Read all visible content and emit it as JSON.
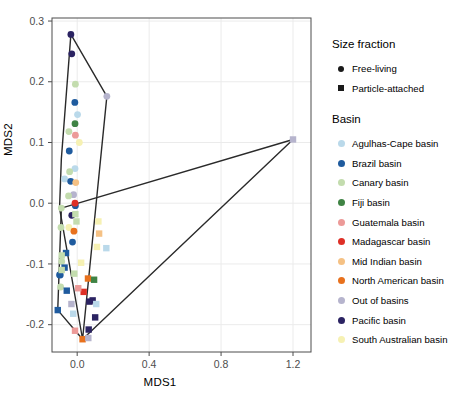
{
  "chart_data": {
    "type": "scatter",
    "title": "",
    "xlabel": "MDS1",
    "ylabel": "MDS2",
    "xlim": [
      -0.14,
      1.3
    ],
    "ylim": [
      -0.245,
      0.305
    ],
    "xticks": [
      0.0,
      0.4,
      0.8,
      1.2
    ],
    "xticklabels": [
      "0.0",
      "0.4",
      "0.8",
      "1.2"
    ],
    "yticks": [
      -0.2,
      -0.1,
      0.0,
      0.1,
      0.2,
      0.3
    ],
    "yticklabels": [
      "-0.2",
      "-0.1",
      "0.0",
      "0.1",
      "0.2",
      "0.3"
    ],
    "grid": true,
    "legend_position": "right",
    "legends": [
      {
        "title": "Size fraction",
        "entries": [
          {
            "label": "Free-living",
            "marker": "circle",
            "color": "#1a1a1a"
          },
          {
            "label": "Particle-attached",
            "marker": "square",
            "color": "#1a1a1a"
          }
        ]
      },
      {
        "title": "Basin",
        "entries": [
          {
            "label": "Agulhas-Cape basin",
            "marker": "circle",
            "color": "#bad9ea"
          },
          {
            "label": "Brazil basin",
            "marker": "circle",
            "color": "#1f5b9e"
          },
          {
            "label": "Canary basin",
            "marker": "circle",
            "color": "#c3dcae"
          },
          {
            "label": "Fiji basin",
            "marker": "circle",
            "color": "#3f8344"
          },
          {
            "label": "Guatemala basin",
            "marker": "circle",
            "color": "#ec9a98"
          },
          {
            "label": "Madagascar basin",
            "marker": "circle",
            "color": "#de2f26"
          },
          {
            "label": "Mid Indian basin",
            "marker": "circle",
            "color": "#f5c184"
          },
          {
            "label": "North American basin",
            "marker": "circle",
            "color": "#e8711d"
          },
          {
            "label": "Out of basins",
            "marker": "circle",
            "color": "#b6b4cd"
          },
          {
            "label": "Pacific basin",
            "marker": "circle",
            "color": "#2b2362"
          },
          {
            "label": "South Australian basin",
            "marker": "circle",
            "color": "#f6f1b3"
          }
        ]
      }
    ],
    "hulls": [
      {
        "name": "free-living-hull",
        "points": [
          [
            -0.035,
            0.278
          ],
          [
            0.165,
            0.176
          ],
          [
            0.03,
            -0.224
          ],
          [
            -0.098,
            -0.008
          ],
          [
            -0.088,
            0.073
          ]
        ]
      },
      {
        "name": "particle-attached-hull",
        "points": [
          [
            -0.088,
            -0.008
          ],
          [
            1.2,
            0.105
          ],
          [
            0.03,
            -0.224
          ],
          [
            -0.108,
            -0.176
          ]
        ]
      }
    ],
    "series": [
      {
        "name": "Free-living",
        "marker": "circle",
        "points": [
          {
            "x": -0.035,
            "y": 0.278,
            "basin": "Pacific basin",
            "color": "#2b2362"
          },
          {
            "x": -0.03,
            "y": 0.246,
            "basin": "Pacific basin",
            "color": "#2b2362"
          },
          {
            "x": -0.01,
            "y": 0.196,
            "basin": "Canary basin",
            "color": "#c3dcae"
          },
          {
            "x": -0.013,
            "y": 0.166,
            "basin": "Brazil basin",
            "color": "#1f5b9e"
          },
          {
            "x": 0.002,
            "y": 0.146,
            "basin": "Agulhas-Cape basin",
            "color": "#bad9ea"
          },
          {
            "x": -0.012,
            "y": 0.131,
            "basin": "Fiji basin",
            "color": "#3f8344"
          },
          {
            "x": -0.046,
            "y": 0.118,
            "basin": "Canary basin",
            "color": "#c3dcae"
          },
          {
            "x": -0.01,
            "y": 0.112,
            "basin": "Guatemala basin",
            "color": "#ec9a98"
          },
          {
            "x": 0.012,
            "y": 0.1,
            "basin": "South Australian basin",
            "color": "#f6f1b3"
          },
          {
            "x": -0.044,
            "y": 0.086,
            "basin": "Brazil basin",
            "color": "#1f5b9e"
          },
          {
            "x": 0.165,
            "y": 0.176,
            "basin": "Out of basins",
            "color": "#b6b4cd"
          },
          {
            "x": -0.012,
            "y": 0.057,
            "basin": "Agulhas-Cape basin",
            "color": "#bad9ea"
          },
          {
            "x": -0.042,
            "y": 0.052,
            "basin": "Canary basin",
            "color": "#c3dcae"
          },
          {
            "x": -0.07,
            "y": 0.04,
            "basin": "Agulhas-Cape basin",
            "color": "#bad9ea"
          },
          {
            "x": -0.036,
            "y": 0.036,
            "basin": "Brazil basin",
            "color": "#1f5b9e"
          },
          {
            "x": -0.008,
            "y": 0.034,
            "basin": "Mid Indian basin",
            "color": "#f5c184"
          },
          {
            "x": -0.02,
            "y": 0.014,
            "basin": "Out of basins",
            "color": "#b6b4cd"
          },
          {
            "x": -0.048,
            "y": 0.012,
            "basin": "Canary basin",
            "color": "#c3dcae"
          },
          {
            "x": -0.01,
            "y": -0.004,
            "basin": "Brazil basin",
            "color": "#1f5b9e"
          },
          {
            "x": -0.088,
            "y": -0.008,
            "basin": "Canary basin",
            "color": "#c3dcae"
          },
          {
            "x": -0.03,
            "y": -0.02,
            "basin": "Pacific basin",
            "color": "#2b2362"
          },
          {
            "x": -0.046,
            "y": -0.04,
            "basin": "South Australian basin",
            "color": "#f6f1b3"
          },
          {
            "x": -0.018,
            "y": -0.046,
            "basin": "North American basin",
            "color": "#e8711d"
          },
          {
            "x": -0.026,
            "y": -0.064,
            "basin": "Brazil basin",
            "color": "#1f5b9e"
          },
          {
            "x": -0.09,
            "y": -0.04,
            "basin": "Canary basin",
            "color": "#c3dcae"
          },
          {
            "x": -0.086,
            "y": -0.096,
            "basin": "Canary basin",
            "color": "#c3dcae"
          },
          {
            "x": -0.094,
            "y": -0.118,
            "basin": "Brazil basin",
            "color": "#1f5b9e"
          },
          {
            "x": -0.098,
            "y": -0.118,
            "basin": "Brazil basin",
            "color": "#1f5b9e"
          },
          {
            "x": -0.092,
            "y": -0.138,
            "basin": "Canary basin",
            "color": "#c3dcae"
          },
          {
            "x": -0.012,
            "y": 0.0,
            "basin": "Madagascar basin",
            "color": "#de2f26"
          }
        ]
      },
      {
        "name": "Particle-attached",
        "marker": "square",
        "points": [
          {
            "x": 1.2,
            "y": 0.105,
            "basin": "Out of basins",
            "color": "#b6b4cd"
          },
          {
            "x": -0.01,
            "y": -0.018,
            "basin": "Canary basin",
            "color": "#c3dcae"
          },
          {
            "x": 0.118,
            "y": -0.03,
            "basin": "South Australian basin",
            "color": "#f6f1b3"
          },
          {
            "x": 0.122,
            "y": -0.05,
            "basin": "Mid Indian basin",
            "color": "#f5c184"
          },
          {
            "x": 0.11,
            "y": -0.072,
            "basin": "South Australian basin",
            "color": "#f6f1b3"
          },
          {
            "x": 0.162,
            "y": -0.074,
            "basin": "Agulhas-Cape basin",
            "color": "#bad9ea"
          },
          {
            "x": -0.062,
            "y": -0.082,
            "basin": "Brazil basin",
            "color": "#1f5b9e"
          },
          {
            "x": -0.086,
            "y": -0.086,
            "basin": "Canary basin",
            "color": "#c3dcae"
          },
          {
            "x": 0.022,
            "y": -0.098,
            "basin": "South Australian basin",
            "color": "#f6f1b3"
          },
          {
            "x": -0.07,
            "y": -0.106,
            "basin": "Brazil basin",
            "color": "#1f5b9e"
          },
          {
            "x": -0.086,
            "y": -0.11,
            "basin": "Canary basin",
            "color": "#c3dcae"
          },
          {
            "x": -0.016,
            "y": -0.116,
            "basin": "Canary basin",
            "color": "#c3dcae"
          },
          {
            "x": 0.06,
            "y": -0.124,
            "basin": "North American basin",
            "color": "#e8711d"
          },
          {
            "x": 0.094,
            "y": -0.126,
            "basin": "Fiji basin",
            "color": "#3f8344"
          },
          {
            "x": -0.058,
            "y": -0.144,
            "basin": "Brazil basin",
            "color": "#1f5b9e"
          },
          {
            "x": 0.036,
            "y": -0.146,
            "basin": "Madagascar basin",
            "color": "#de2f26"
          },
          {
            "x": 0.006,
            "y": -0.14,
            "basin": "Guatemala basin",
            "color": "#ec9a98"
          },
          {
            "x": 0.068,
            "y": -0.162,
            "basin": "Pacific basin",
            "color": "#2b2362"
          },
          {
            "x": 0.086,
            "y": -0.16,
            "basin": "Pacific basin",
            "color": "#2b2362"
          },
          {
            "x": -0.032,
            "y": -0.166,
            "basin": "Out of basins",
            "color": "#b6b4cd"
          },
          {
            "x": 0.106,
            "y": -0.166,
            "basin": "Agulhas-Cape basin",
            "color": "#bad9ea"
          },
          {
            "x": -0.108,
            "y": -0.176,
            "basin": "Brazil basin",
            "color": "#1f5b9e"
          },
          {
            "x": -0.022,
            "y": -0.182,
            "basin": "Agulhas-Cape basin",
            "color": "#bad9ea"
          },
          {
            "x": 0.1,
            "y": -0.188,
            "basin": "Pacific basin",
            "color": "#2b2362"
          },
          {
            "x": -0.012,
            "y": -0.21,
            "basin": "Guatemala basin",
            "color": "#ec9a98"
          },
          {
            "x": 0.064,
            "y": -0.208,
            "basin": "Pacific basin",
            "color": "#2b2362"
          },
          {
            "x": 0.03,
            "y": -0.224,
            "basin": "North American basin",
            "color": "#e8711d"
          },
          {
            "x": 0.062,
            "y": -0.222,
            "basin": "Out of basins",
            "color": "#b6b4cd"
          },
          {
            "x": -0.004,
            "y": -0.03,
            "basin": "Canary basin",
            "color": "#c3dcae"
          }
        ]
      }
    ]
  },
  "style": {
    "panel_bg": "#ffffff",
    "panel_border": "#4d4d4d",
    "grid_color": "#ebebeb",
    "hull_color": "#2a2a2a",
    "tick_color": "#4d4d4d",
    "text_color": "#000000"
  }
}
